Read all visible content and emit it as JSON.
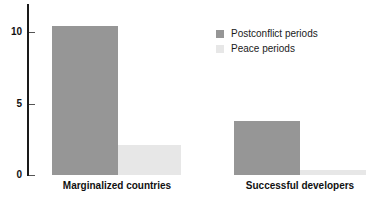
{
  "chart_data": {
    "type": "bar",
    "title": "",
    "subtitle": "",
    "xlabel": "",
    "ylabel": "",
    "categories": [
      "Marginalized countries",
      "Successful developers"
    ],
    "series": [
      {
        "name": "Postconflict periods",
        "color": "#969696",
        "values": [
          10.4,
          3.8
        ]
      },
      {
        "name": "Peace periods",
        "color": "#e7e7e7",
        "values": [
          2.1,
          0.35
        ]
      }
    ],
    "ylim": [
      0,
      12
    ],
    "yticks": [
      0,
      5,
      10
    ],
    "ytick_labels": [
      "0",
      "5",
      "10"
    ],
    "grid": false,
    "legend_position": "top-right"
  },
  "axis": {
    "ticks": [
      {
        "label": "10",
        "value": 10
      },
      {
        "label": "5",
        "value": 5
      },
      {
        "label": "0",
        "value": 0
      }
    ]
  },
  "legend": {
    "entries": [
      {
        "label": "Postconflict periods",
        "swatch": "dark"
      },
      {
        "label": "Peace periods",
        "swatch": "light"
      }
    ]
  },
  "categories": [
    {
      "label": "Marginalized countries"
    },
    {
      "label": "Successful developers"
    }
  ],
  "colors": {
    "postconflict": "#969696",
    "peace": "#e7e7e7",
    "axis": "#1a1a1a",
    "text": "#111111",
    "background": "#ffffff"
  }
}
